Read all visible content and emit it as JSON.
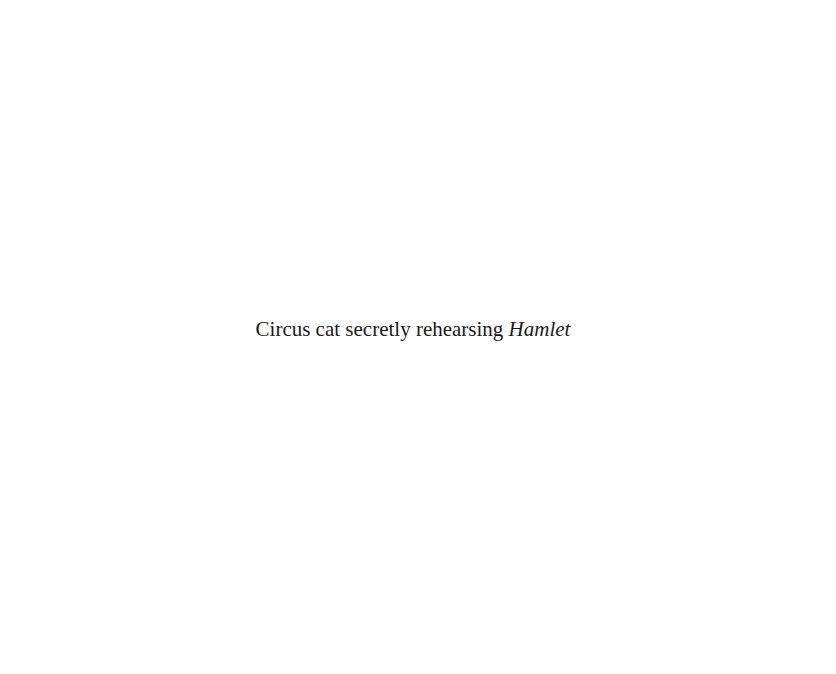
{
  "caption": {
    "text": "Circus cat secretly rehearsing",
    "italic_title": "Hamlet"
  },
  "colors": {
    "background": "#ffffff",
    "text": "#1a1a1a"
  }
}
